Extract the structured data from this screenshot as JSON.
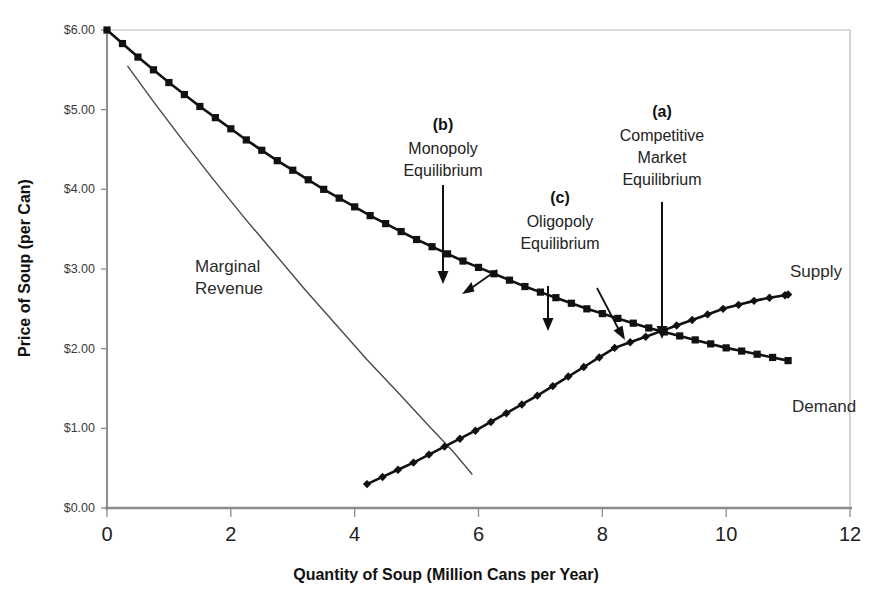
{
  "chart_data": {
    "type": "line",
    "title": "",
    "xlabel": "Quantity of Soup (Million Cans per Year)",
    "ylabel": "Price of Soup (per Can)",
    "xlim": [
      0,
      12
    ],
    "ylim": [
      0,
      6
    ],
    "xticks": [
      "0",
      "2",
      "4",
      "6",
      "8",
      "10",
      "12"
    ],
    "xtick_values": [
      0,
      2,
      4,
      6,
      8,
      10,
      12
    ],
    "yticks": [
      "$0.00",
      "$1.00",
      "$2.00",
      "$3.00",
      "$4.00",
      "$5.00",
      "$6.00"
    ],
    "ytick_values": [
      0,
      1,
      2,
      3,
      4,
      5,
      6
    ],
    "grid": false,
    "legend": "inline-labels",
    "series": [
      {
        "name": "Demand",
        "marker": "square",
        "x": [
          0,
          0.25,
          0.5,
          0.75,
          1,
          1.25,
          1.5,
          1.75,
          2,
          2.25,
          2.5,
          2.75,
          3,
          3.25,
          3.5,
          3.75,
          4,
          4.25,
          4.5,
          4.75,
          5,
          5.25,
          5.5,
          5.75,
          6,
          6.25,
          6.5,
          6.75,
          7,
          7.25,
          7.5,
          7.75,
          8,
          8.25,
          8.5,
          8.75,
          9,
          9.25,
          9.5,
          9.75,
          10,
          10.25,
          10.5,
          10.75,
          11
        ],
        "y": [
          6.0,
          5.83,
          5.66,
          5.5,
          5.34,
          5.19,
          5.04,
          4.9,
          4.76,
          4.62,
          4.49,
          4.36,
          4.24,
          4.12,
          4.0,
          3.89,
          3.78,
          3.67,
          3.57,
          3.47,
          3.37,
          3.28,
          3.19,
          3.1,
          3.02,
          2.94,
          2.86,
          2.78,
          2.71,
          2.64,
          2.57,
          2.5,
          2.44,
          2.38,
          2.32,
          2.26,
          2.21,
          2.16,
          2.11,
          2.06,
          2.01,
          1.97,
          1.93,
          1.89,
          1.85
        ]
      },
      {
        "name": "Supply",
        "marker": "diamond",
        "x": [
          4.2,
          4.45,
          4.7,
          4.95,
          5.2,
          5.45,
          5.7,
          5.95,
          6.2,
          6.45,
          6.7,
          6.95,
          7.2,
          7.45,
          7.7,
          7.95,
          8.2,
          8.45,
          8.7,
          8.95,
          9.2,
          9.45,
          9.7,
          9.95,
          10.2,
          10.45,
          10.7,
          10.95,
          11.0
        ],
        "y": [
          0.3,
          0.39,
          0.48,
          0.57,
          0.67,
          0.77,
          0.87,
          0.97,
          1.08,
          1.19,
          1.3,
          1.41,
          1.53,
          1.65,
          1.77,
          1.89,
          2.01,
          2.08,
          2.15,
          2.22,
          2.29,
          2.36,
          2.43,
          2.5,
          2.55,
          2.6,
          2.64,
          2.67,
          2.68
        ]
      },
      {
        "name": "Marginal Revenue",
        "marker": "none",
        "x": [
          0.33,
          0.75,
          1.2,
          1.7,
          2.2,
          2.7,
          3.2,
          3.7,
          4.2,
          4.7,
          5.2,
          5.6,
          5.9
        ],
        "y": [
          5.55,
          5.1,
          4.64,
          4.14,
          3.66,
          3.2,
          2.74,
          2.3,
          1.86,
          1.45,
          1.03,
          0.7,
          0.42
        ]
      }
    ],
    "series_labels": [
      {
        "name": "Supply",
        "x_px": 790,
        "y_px": 277
      },
      {
        "name": "Demand",
        "x_px": 792,
        "y_px": 412
      },
      {
        "name": "Marginal Revenue",
        "line1": "Marginal",
        "line2": "Revenue",
        "x_px": 237,
        "y_px": 272
      }
    ],
    "annotations": [
      {
        "id": "b",
        "tag": "(b)",
        "line1": "Monopoly",
        "line2": "Equilibrium",
        "text_x_px": 443,
        "tag_y_px": 130,
        "arrows": [
          "vertical-down",
          "diagonal-down-left"
        ],
        "points_to": {
          "x": 5.4,
          "y": 3.2
        }
      },
      {
        "id": "c",
        "tag": "(c)",
        "line1": "Oligopoly",
        "line2": "Equilibrium",
        "text_x_px": 560,
        "tag_y_px": 203,
        "arrows": [
          "vertical-down",
          "diagonal-down-right"
        ],
        "points_to": {
          "x": 7.1,
          "y": 2.45
        }
      },
      {
        "id": "a",
        "tag": "(a)",
        "line1": "Competitive",
        "line2": "Market",
        "line3": "Equilibrium",
        "text_x_px": 662,
        "tag_y_px": 117,
        "arrows": [
          "vertical-down"
        ],
        "points_to": {
          "x": 9.0,
          "y": 1.8
        }
      }
    ],
    "equilibrium_intersection": {
      "x": 9.0,
      "y": 1.8
    }
  },
  "colors": {
    "series": "#111111",
    "marginal_revenue": "#4a4a4a",
    "axis": "#9a9a9a",
    "text": "#1a1a1a",
    "background": "#ffffff"
  }
}
